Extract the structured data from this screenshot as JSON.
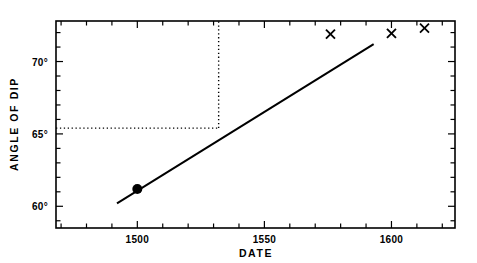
{
  "chart_data": {
    "type": "scatter",
    "title": "",
    "subtitle": "",
    "xlabel": "DATE",
    "ylabel": "ANGLE  OF  DIP",
    "xlim": [
      1468,
      1625
    ],
    "ylim": [
      72.8,
      58.5
    ],
    "y_inverted": true,
    "grid": false,
    "legend": "none",
    "x_ticks_major": [
      1500,
      1550,
      1600
    ],
    "x_tick_labels": [
      "1500",
      "1550",
      "1600"
    ],
    "x_tick_minor_step": 10,
    "y_ticks_major": [
      60,
      65,
      70
    ],
    "y_tick_labels": [
      "60°",
      "65°",
      "70°"
    ],
    "y_tick_minor_step": 1,
    "series": [
      {
        "name": "measured-dip-filled-circle",
        "marker": "filled-circle",
        "points": [
          {
            "x": 1500,
            "y": 61.2
          }
        ]
      },
      {
        "name": "measured-dip-cross",
        "marker": "cross",
        "points": [
          {
            "x": 1576,
            "y": 71.9
          },
          {
            "x": 1600,
            "y": 71.95
          },
          {
            "x": 1613,
            "y": 72.3
          }
        ]
      }
    ],
    "trend_line": {
      "name": "secular-variation-trend-line",
      "style": "solid",
      "x_start": 1492,
      "y_start": 60.2,
      "x_end": 1593,
      "y_end": 71.2
    },
    "guide_lines": [
      {
        "name": "horizontal-dotted-guide",
        "style": "dotted",
        "orientation": "horizontal",
        "y": 65.4,
        "x_from": 1468,
        "x_to": 1532
      },
      {
        "name": "vertical-dotted-guide",
        "style": "dotted",
        "orientation": "vertical",
        "x": 1532,
        "y_from": 65.4,
        "y_to": 72.8
      }
    ],
    "annotations": [],
    "colors": {
      "axis": "#000000",
      "data": "#000000",
      "background": "#ffffff"
    }
  },
  "axes": {
    "x_title": "DATE",
    "y_title": "ANGLE  OF  DIP",
    "x_labels": [
      "1500",
      "1550",
      "1600"
    ],
    "y_labels": [
      "60°",
      "65°",
      "70°"
    ]
  }
}
